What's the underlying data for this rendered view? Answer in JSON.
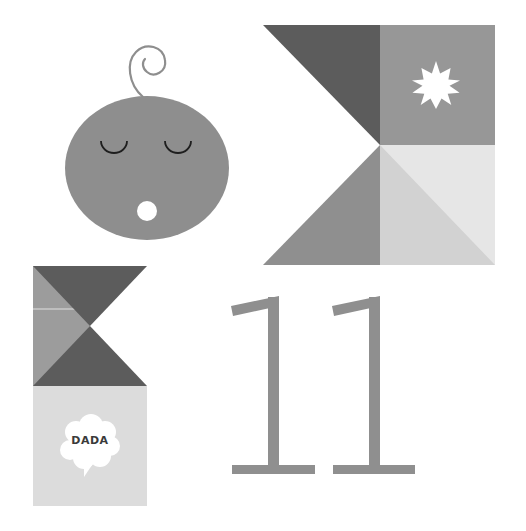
{
  "canvas": {
    "width": 526,
    "height": 531,
    "background": "#ffffff"
  },
  "colors": {
    "dark": "#5c5c5c",
    "medium": "#8f8f8f",
    "head": "#8e8e8e",
    "light": "#dadada",
    "lighter": "#e6e6e6",
    "white": "#ffffff",
    "eye": "#1e1e1e"
  },
  "baby_face": {
    "head": {
      "cx": 147,
      "cy": 168,
      "rx": 82,
      "ry": 72
    },
    "eyes": "closed",
    "mouth": "open"
  },
  "sun_panel": {
    "rays": 16
  },
  "speech_bubble": {
    "text": "DADA"
  },
  "number": {
    "text": "11"
  }
}
